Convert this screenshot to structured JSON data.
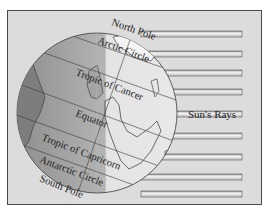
{
  "diagram": {
    "labels": {
      "north_pole": "North Pole",
      "arctic_circle": "Arctic Circle",
      "tropic_of_cancer": "Tropic of Cancer",
      "equator": "Equator",
      "tropic_of_capricorn": "Tropic of Capricorn",
      "antarctic_circle": "Antarctic Circle",
      "south_pole": "South Pole",
      "suns_rays": "Sun's Rays"
    },
    "ray_count": 9,
    "colors": {
      "background": "#dcdcdc",
      "night_side": "#9a9a9a",
      "day_side": "#e2e2e2",
      "ray_fill": "#f2f2f2",
      "outline": "#3a3a3a"
    }
  }
}
